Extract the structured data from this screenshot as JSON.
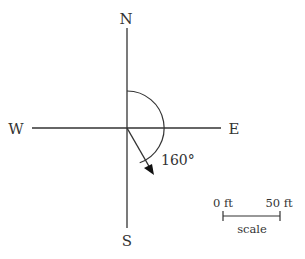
{
  "compass": {
    "north": "N",
    "south": "S",
    "east": "E",
    "west": "W"
  },
  "bearing": {
    "angle_label": "160°",
    "angle_degrees": 160
  },
  "scale": {
    "start_label": "0 ft",
    "end_label": "50 ft",
    "caption": "scale"
  },
  "colors": {
    "line": "#333333",
    "background": "#ffffff"
  }
}
